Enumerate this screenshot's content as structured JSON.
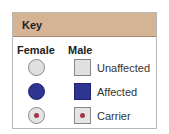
{
  "key": {
    "title": "Key",
    "columns": {
      "female": "Female",
      "male": "Male"
    },
    "rows": [
      {
        "label": "Unaffected",
        "color": "#e0e0e0"
      },
      {
        "label": "Affected",
        "color": "#2e3591"
      },
      {
        "label": "Carrier",
        "color": "#e4e4e4",
        "dot_color": "#a0384a"
      }
    ],
    "header_color": "#d4b494"
  }
}
